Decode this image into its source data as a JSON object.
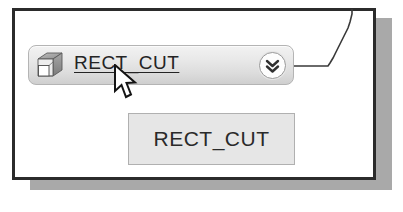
{
  "window": {
    "name": "feature-tree-panel",
    "background_color": "#ffffff",
    "border_color": "#2b2b2b",
    "shadow_color": "#a9a9a9"
  },
  "feature_item": {
    "label": "RECT_CUT",
    "icon": "3d-box-cut-icon",
    "is_link": true,
    "underlined": true,
    "expand_button_icon": "double-chevron-down-icon",
    "background_gradient_top": "#f2f2f2",
    "background_gradient_bottom": "#cfcfcf",
    "border_color": "#b4b4b4",
    "text_color": "#242424"
  },
  "tooltip": {
    "text": "RECT_CUT",
    "background_color": "#e6e6e6",
    "border_color": "#b0b0b0",
    "text_color": "#2a2a2a"
  },
  "cursor": {
    "icon": "mouse-pointer-arrow",
    "fill_color": "#ffffff",
    "outline_color": "#1a1a1a"
  },
  "connector": {
    "icon": "leader-line",
    "color": "#3a3a3a"
  }
}
